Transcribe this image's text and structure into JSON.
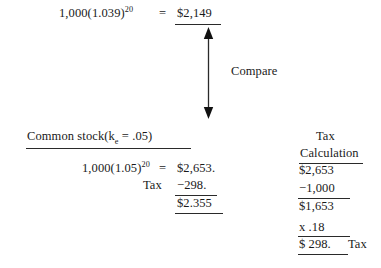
{
  "figure": {
    "background_color": "#ffffff",
    "text_color": "#1a1a1a"
  },
  "top_expression": {
    "left": "1,000(1.039)",
    "exponent": "20",
    "equals": "=",
    "value": "$2,149"
  },
  "compare": {
    "label": "Compare",
    "arrow_icon": "double-headed-vertical-arrow"
  },
  "common_stock": {
    "label_prefix": "Common stock(k",
    "label_sub": "e",
    "label_suffix": " = .05)",
    "expression_left": "1,000(1.05)",
    "expression_exponent": "20",
    "equals": "=",
    "gross_value": "$2,653.",
    "tax_label": "Tax",
    "tax_value": "−298.",
    "net_value": "$2.355"
  },
  "tax_calculation": {
    "title_line1": "Tax",
    "title_line2": "Calculation",
    "rows": [
      "$2,653",
      "−1,000",
      "$1,653",
      "x    .18",
      "$    298."
    ],
    "final_note": "Tax"
  }
}
